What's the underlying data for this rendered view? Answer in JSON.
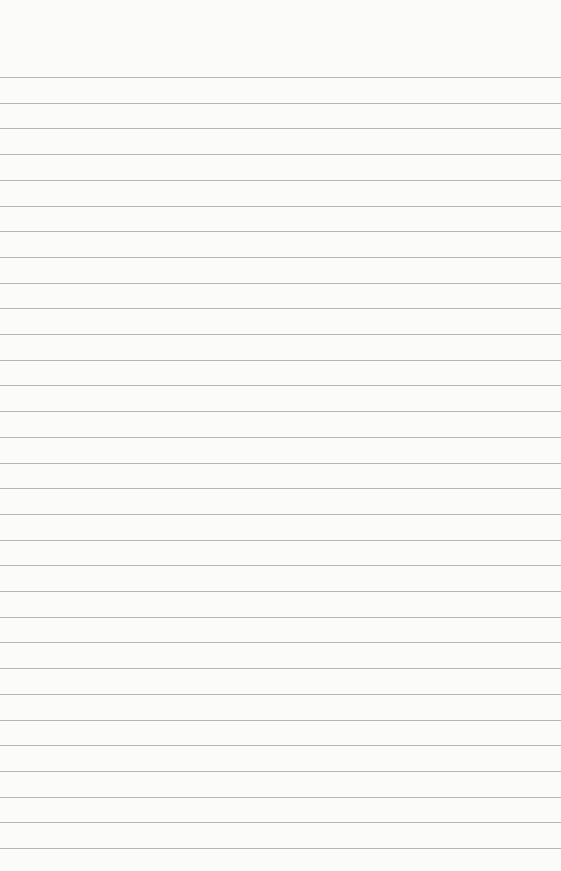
{
  "paper": {
    "type": "lined-paper",
    "background_color": "#fbfbfa",
    "line_color": "#a9a9a6",
    "line_count": 31,
    "first_line_y": 77,
    "line_spacing": 25.7
  }
}
